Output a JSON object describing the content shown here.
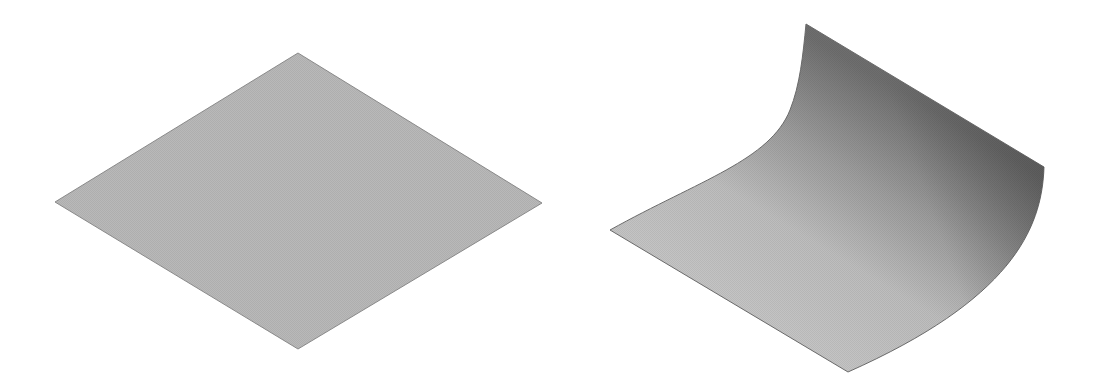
{
  "figures": [
    {
      "name": "flat-surface",
      "colors": {
        "fill": "#b8b8b8",
        "edge": "#8a8a8a"
      }
    },
    {
      "name": "curved-surface",
      "colors": {
        "light": "#c2c2c2",
        "mid": "#a9a9a9",
        "dark": "#727272",
        "edge": "#6a6a6a"
      }
    }
  ]
}
